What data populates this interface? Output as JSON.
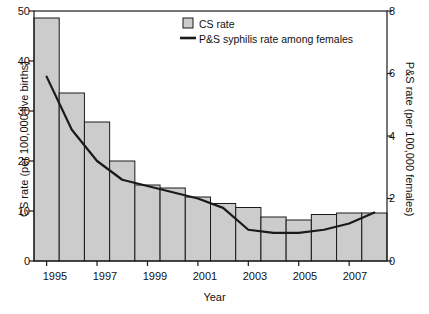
{
  "chart_data": {
    "type": "bar",
    "title": "",
    "subtitle": "",
    "xlabel": "Year",
    "ylabel": "CS rate (per 100,000 live births)",
    "y2label": "P&S rate (per 100,000 females)",
    "categories": [
      "1995",
      "1996",
      "1997",
      "1998",
      "1999",
      "2000",
      "2001",
      "2002",
      "2003",
      "2004",
      "2005",
      "2006",
      "2007",
      "2008"
    ],
    "x_tick_labels": [
      "1995",
      "1997",
      "1999",
      "2001",
      "2003",
      "2005",
      "2007"
    ],
    "y_tick_labels": [
      "0",
      "10",
      "20",
      "30",
      "40",
      "50"
    ],
    "y2_tick_labels": [
      "0",
      "2",
      "4",
      "6",
      "8"
    ],
    "ylim": [
      0,
      50
    ],
    "y2lim": [
      0,
      8
    ],
    "grid": false,
    "legend_position": "top-center",
    "series": [
      {
        "name": "CS rate",
        "type": "bar",
        "axis": "left",
        "color": "#cccccc",
        "edge_color": "#1a1a1a",
        "values": [
          48.6,
          33.6,
          27.8,
          20.0,
          15.2,
          14.6,
          12.8,
          11.5,
          10.7,
          8.8,
          8.2,
          9.3,
          9.6,
          9.6
        ]
      },
      {
        "name": "P&S syphilis rate among females",
        "type": "line",
        "axis": "right",
        "color": "#1a1a1a",
        "values": [
          5.9,
          4.2,
          3.2,
          2.6,
          2.4,
          2.2,
          2.0,
          1.7,
          1.0,
          0.9,
          0.9,
          1.0,
          1.2,
          1.55
        ]
      }
    ]
  },
  "legend": {
    "items": [
      {
        "label": "CS rate",
        "marker": "swatch"
      },
      {
        "label": "P&S syphilis rate among females",
        "marker": "line"
      }
    ]
  },
  "axes": {
    "left_title": "CS rate (per 100,000 live births)",
    "right_title": "P&S rate (per 100,000 females)",
    "bottom_title": "Year"
  }
}
